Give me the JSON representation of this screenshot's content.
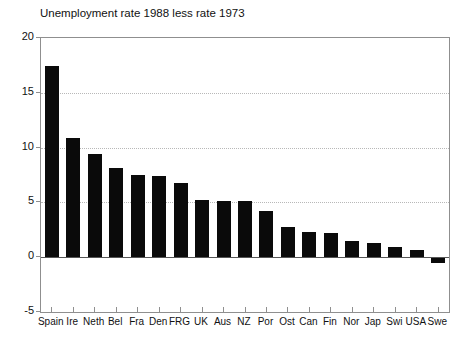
{
  "title": "Unemployment rate 1988 less rate 1973",
  "chart_data": {
    "type": "bar",
    "title": "Unemployment rate 1988 less rate 1973",
    "categories": [
      "Spain",
      "Ire",
      "Neth",
      "Bel",
      "Fra",
      "Den",
      "FRG",
      "UK",
      "Aus",
      "NZ",
      "Por",
      "Ost",
      "Can",
      "Fin",
      "Nor",
      "Jap",
      "Swi",
      "USA",
      "Swe"
    ],
    "values": [
      17.4,
      10.9,
      9.4,
      8.1,
      7.5,
      7.4,
      6.8,
      5.2,
      5.1,
      5.1,
      4.2,
      2.8,
      2.3,
      2.2,
      1.5,
      1.3,
      0.9,
      0.7,
      -0.4
    ],
    "xlabel": "",
    "ylabel": "",
    "ylim": [
      -5,
      20
    ],
    "yticks": [
      20,
      15,
      10,
      5,
      0,
      -5
    ],
    "gridlines_at": [
      15,
      10,
      5
    ],
    "grid_style": "dotted",
    "legend": "none",
    "bar_color": "#0a0a0a",
    "frame_color": "#8f8f8f",
    "grid_color": "#b8b8b8",
    "baseline_color": "#555555",
    "background_color": "#ffffff"
  }
}
